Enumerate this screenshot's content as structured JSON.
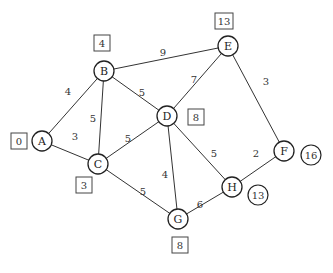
{
  "graph": {
    "nodes": [
      {
        "id": "A",
        "x": 42,
        "y": 141
      },
      {
        "id": "B",
        "x": 104,
        "y": 71
      },
      {
        "id": "C",
        "x": 98,
        "y": 164
      },
      {
        "id": "D",
        "x": 167,
        "y": 116
      },
      {
        "id": "E",
        "x": 228,
        "y": 46
      },
      {
        "id": "F",
        "x": 284,
        "y": 151
      },
      {
        "id": "G",
        "x": 178,
        "y": 219
      },
      {
        "id": "H",
        "x": 232,
        "y": 187
      }
    ],
    "edges": [
      {
        "from": "A",
        "to": "B",
        "weight": "4",
        "lx": 68,
        "ly": 91
      },
      {
        "from": "A",
        "to": "C",
        "weight": "3",
        "lx": 75,
        "ly": 136
      },
      {
        "from": "B",
        "to": "C",
        "weight": "5",
        "lx": 93,
        "ly": 118
      },
      {
        "from": "B",
        "to": "D",
        "weight": "5",
        "lx": 142,
        "ly": 92
      },
      {
        "from": "B",
        "to": "E",
        "weight": "9",
        "lx": 163,
        "ly": 52
      },
      {
        "from": "C",
        "to": "D",
        "weight": "5",
        "lx": 128,
        "ly": 138
      },
      {
        "from": "C",
        "to": "G",
        "weight": "5",
        "lx": 143,
        "ly": 191
      },
      {
        "from": "D",
        "to": "E",
        "weight": "7",
        "lx": 194,
        "ly": 79
      },
      {
        "from": "D",
        "to": "G",
        "weight": "4",
        "lx": 165,
        "ly": 174
      },
      {
        "from": "D",
        "to": "H",
        "weight": "5",
        "lx": 214,
        "ly": 153
      },
      {
        "from": "E",
        "to": "F",
        "weight": "3",
        "lx": 266,
        "ly": 81
      },
      {
        "from": "F",
        "to": "H",
        "weight": "2",
        "lx": 256,
        "ly": 153
      },
      {
        "from": "G",
        "to": "H",
        "weight": "6",
        "lx": 200,
        "ly": 204
      }
    ],
    "box_labels": [
      {
        "node": "A",
        "value": "0",
        "x": 19,
        "y": 141,
        "w": 16
      },
      {
        "node": "B",
        "value": "4",
        "x": 102,
        "y": 43,
        "w": 16
      },
      {
        "node": "C",
        "value": "3",
        "x": 84,
        "y": 185,
        "w": 16
      },
      {
        "node": "D",
        "value": "8",
        "x": 196,
        "y": 117,
        "w": 16
      },
      {
        "node": "E",
        "value": "13",
        "x": 224,
        "y": 21,
        "w": 18
      },
      {
        "node": "G",
        "value": "8",
        "x": 180,
        "y": 245,
        "w": 16
      }
    ],
    "circle_labels": [
      {
        "node": "F",
        "value": "16",
        "x": 311,
        "y": 155
      },
      {
        "node": "H",
        "value": "13",
        "x": 258,
        "y": 195
      }
    ]
  }
}
